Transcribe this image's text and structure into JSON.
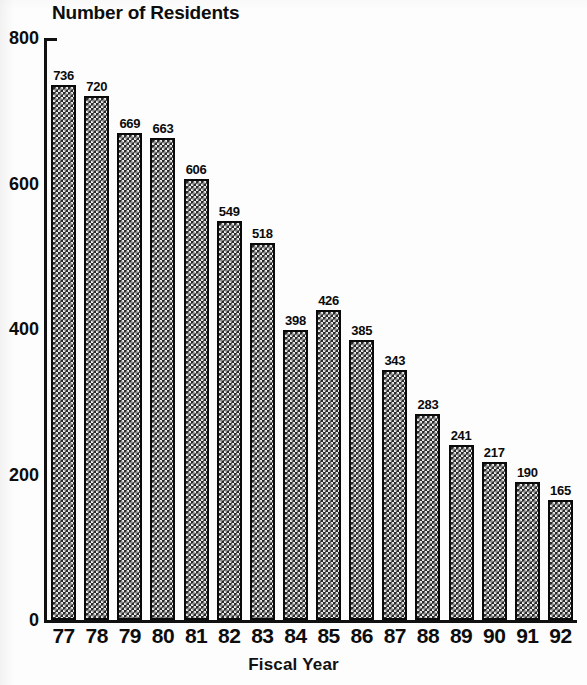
{
  "chart_data": {
    "type": "bar",
    "title": "Number of Residents",
    "xlabel": "Fiscal Year",
    "ylabel": "",
    "categories": [
      "77",
      "78",
      "79",
      "80",
      "81",
      "82",
      "83",
      "84",
      "85",
      "86",
      "87",
      "88",
      "89",
      "90",
      "91",
      "92"
    ],
    "values": [
      736,
      720,
      669,
      663,
      606,
      549,
      518,
      398,
      426,
      385,
      343,
      283,
      241,
      217,
      190,
      165
    ],
    "value_labels": [
      "736",
      "720",
      "669",
      "663",
      "606",
      "549",
      "518",
      "398",
      "426",
      "385",
      "343",
      "283",
      "241",
      "217",
      "190",
      "165"
    ],
    "ylim": [
      0,
      800
    ],
    "yticks": [
      0,
      200,
      400,
      600,
      800
    ],
    "ytick_labels": [
      "0",
      "200",
      "400",
      "600",
      "800"
    ],
    "grid": false,
    "legend": null,
    "bar_fill": "#2b2b2b",
    "bar_edge": "#0a0a0a",
    "text_color": "#0d0d0d",
    "background": "#ffffff"
  }
}
